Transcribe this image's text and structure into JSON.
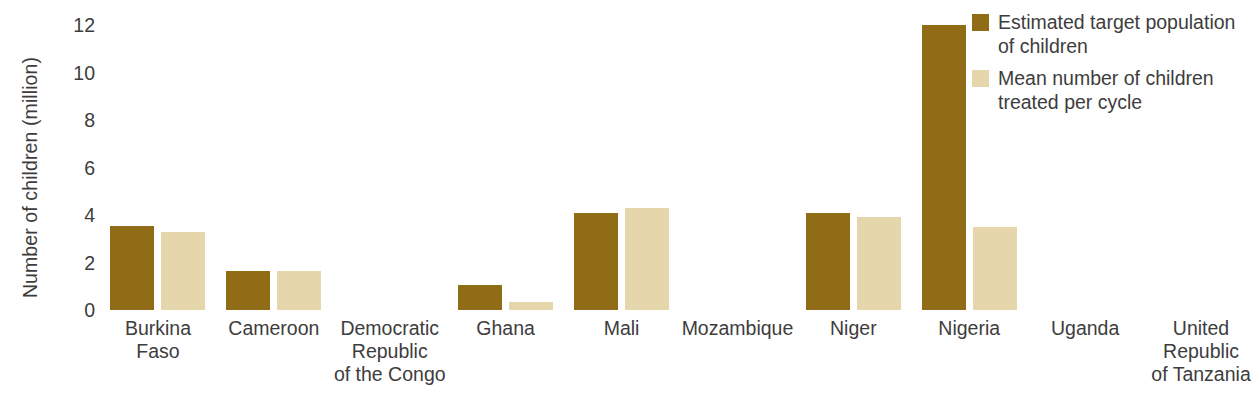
{
  "figure": {
    "title_sliver": "",
    "background": "#ffffff"
  },
  "colors": {
    "series_dark": "#8f6c15",
    "series_light": "#e6d6ab",
    "text": "#3d3d3d"
  },
  "legend": {
    "position": "top-right",
    "items": [
      {
        "label": "Estimated target population\nof children",
        "color": "#8f6c15",
        "swatch": "legend-swatch-dark"
      },
      {
        "label": "Mean number of children\ntreated per cycle",
        "color": "#e6d6ab",
        "swatch": "legend-swatch-light"
      }
    ]
  },
  "chart_data": {
    "type": "bar",
    "title": "",
    "xlabel": "",
    "ylabel": "Number of children (million)",
    "ylim": [
      0,
      12
    ],
    "yticks": [
      0,
      2,
      4,
      6,
      8,
      10,
      12
    ],
    "ytick_labels": [
      "0",
      "2",
      "4",
      "6",
      "8",
      "10",
      "12"
    ],
    "grid": false,
    "legend_position": "top-right",
    "categories": [
      "Burkina\nFaso",
      "Cameroon",
      "Democratic\nRepublic\nof the Congo",
      "Ghana",
      "Mali",
      "Mozambique",
      "Niger",
      "Nigeria",
      "Uganda",
      "United\nRepublic\nof Tanzania"
    ],
    "series": [
      {
        "name": "Estimated target population of children",
        "color": "#8f6c15",
        "values": [
          3.55,
          1.65,
          0,
          1.05,
          4.1,
          0,
          4.1,
          12.0,
          0,
          0
        ]
      },
      {
        "name": "Mean number of children treated per cycle",
        "color": "#e6d6ab",
        "values": [
          3.3,
          1.65,
          0,
          0.35,
          4.3,
          0,
          3.9,
          3.5,
          0,
          0
        ]
      }
    ]
  }
}
